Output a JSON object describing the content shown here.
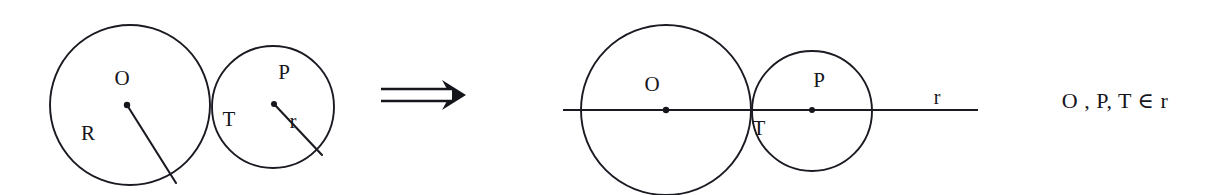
{
  "figure": {
    "background_color": "#ffffff",
    "ink_color": "#15151c",
    "width": 1230,
    "height": 195,
    "caption_formula": "O , P, T ∈ r",
    "implication_symbol": "⟹"
  },
  "left_diagram": {
    "name": "two tangent circles with radii marked",
    "big_circle": {
      "center_label": "O",
      "radius_label": "R",
      "center_x": 130,
      "center_y": 105,
      "radius": 80
    },
    "small_circle": {
      "center_label": "P",
      "radius_label": "r",
      "tangency_label": "T",
      "center_x": 273,
      "center_y": 107,
      "radius": 61
    },
    "labels": [
      {
        "text": "O",
        "x": 122,
        "y": 78
      },
      {
        "text": "R",
        "x": 88,
        "y": 133
      },
      {
        "text": "P",
        "x": 284,
        "y": 72
      },
      {
        "text": "T",
        "x": 229,
        "y": 119
      },
      {
        "text": "r",
        "x": 293,
        "y": 121
      }
    ]
  },
  "right_diagram": {
    "name": "two tangent circles on the line of centers r",
    "big_circle": {
      "center_label": "O",
      "center_x": 666,
      "center_y": 110,
      "radius": 85
    },
    "small_circle": {
      "center_label": "P",
      "tangency_label": "T",
      "center_x": 812,
      "center_y": 111,
      "radius": 60
    },
    "line": {
      "label": "r",
      "x_start": 563,
      "x_end": 978,
      "y": 110
    },
    "labels": [
      {
        "text": "O",
        "x": 652,
        "y": 84
      },
      {
        "text": "P",
        "x": 819,
        "y": 80
      },
      {
        "text": "T",
        "x": 759,
        "y": 128
      },
      {
        "text": "r",
        "x": 937,
        "y": 97
      }
    ]
  }
}
